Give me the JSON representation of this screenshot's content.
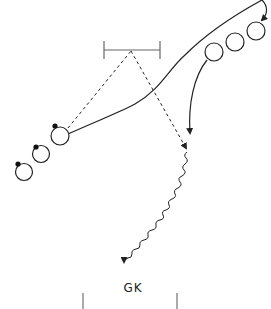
{
  "diagram": {
    "type": "soccer-drill",
    "labels": {
      "goalkeeper": "GK"
    },
    "colors": {
      "line": "#222222",
      "gate": "#666666",
      "post": "#555555",
      "ball": "#111111",
      "background": "#ffffff"
    },
    "elements": {
      "mini_gate": {
        "x1": 104,
        "x2": 160,
        "y": 50
      },
      "players_left": [
        {
          "cx": 60,
          "cy": 136,
          "has_ball": true
        },
        {
          "cx": 41,
          "cy": 154,
          "has_ball": true
        },
        {
          "cx": 24,
          "cy": 172,
          "has_ball": true
        }
      ],
      "players_right": [
        {
          "cx": 214,
          "cy": 52
        },
        {
          "cx": 235,
          "cy": 42
        },
        {
          "cx": 255,
          "cy": 31
        }
      ],
      "goal_posts": {
        "left_x": 83,
        "right_x": 177,
        "top_y": 293
      }
    },
    "line_legend": {
      "dashed": "pass",
      "solid": "player run",
      "wavy": "dribble"
    }
  }
}
